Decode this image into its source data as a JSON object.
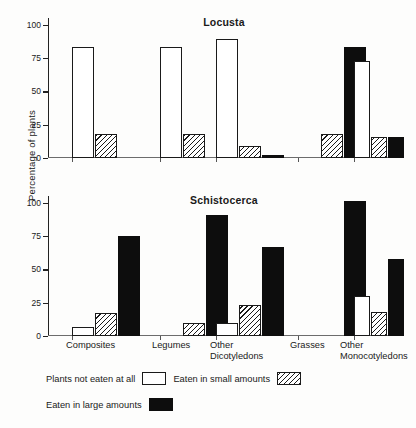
{
  "chart_data": {
    "type": "bar",
    "title": "",
    "ylabel": "Percentage of plants",
    "xlabel": "",
    "ylim": [
      0,
      105
    ],
    "yticks": [
      0,
      25,
      50,
      75,
      100
    ],
    "grid": false,
    "legend_position": "bottom-left",
    "categories": [
      "Composites",
      "Legumes",
      "Other\nDicotyledons",
      "Grasses",
      "Other\nMonocotyledons"
    ],
    "series": [
      {
        "name": "Plants not eaten at all",
        "fill": "white"
      },
      {
        "name": "Eaten in small amounts",
        "fill": "hatched"
      },
      {
        "name": "Eaten in large amounts",
        "fill": "black"
      }
    ],
    "panels": [
      {
        "title": "Locusta",
        "values": [
          {
            "category": "Composites",
            "not_eaten": 83,
            "small": 18,
            "large": 0
          },
          {
            "category": "Legumes",
            "not_eaten": 83,
            "small": 18,
            "large": 0
          },
          {
            "category": "Other Dicotyledons",
            "not_eaten": 89,
            "small": 9,
            "large": 2
          },
          {
            "category": "Grasses",
            "not_eaten": 0,
            "small": 18,
            "large": 83
          },
          {
            "category": "Other Monocotyledons",
            "not_eaten": 73,
            "small": 16,
            "large": 16
          }
        ]
      },
      {
        "title": "Schistocerca",
        "values": [
          {
            "category": "Composites",
            "not_eaten": 7,
            "small": 17,
            "large": 75
          },
          {
            "category": "Legumes",
            "not_eaten": 0,
            "small": 10,
            "large": 91
          },
          {
            "category": "Other Dicotyledons",
            "not_eaten": 10,
            "small": 23,
            "large": 67
          },
          {
            "category": "Grasses",
            "not_eaten": 0,
            "small": 0,
            "large": 101
          },
          {
            "category": "Other Monocotyledons",
            "not_eaten": 30,
            "small": 18,
            "large": 58
          }
        ]
      }
    ]
  },
  "axis": {
    "y_title": "Percentage of plants",
    "ticks": [
      "100",
      "75",
      "50",
      "25",
      "0"
    ]
  },
  "panels": {
    "top_title": "Locusta",
    "bottom_title": "Schistocerca"
  },
  "xlabels": [
    "Composites",
    "Legumes",
    "Other\nDicotyledons",
    "Grasses",
    "Other\nMonocotyledons"
  ],
  "legend": {
    "item1": "Plants not eaten at all",
    "item2": "Eaten in small amounts",
    "item3": "Eaten in large amounts"
  }
}
